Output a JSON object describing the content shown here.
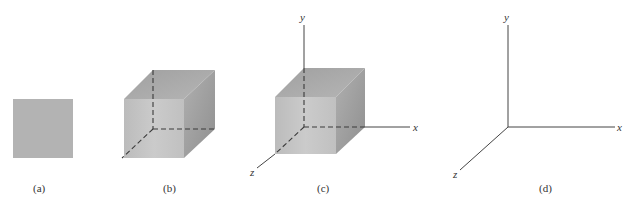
{
  "figure": {
    "panels": [
      {
        "id": "a",
        "label": "(a)",
        "description": "square"
      },
      {
        "id": "b",
        "label": "(b)",
        "description": "cube with hidden edges dashed"
      },
      {
        "id": "c",
        "label": "(c)",
        "description": "cube placed on x-y-z axes"
      },
      {
        "id": "d",
        "label": "(d)",
        "description": "x-y-z axes"
      }
    ],
    "axes_labels": {
      "x": "x",
      "y": "y",
      "z": "z"
    },
    "colors": {
      "face_front": "#b9b9b9",
      "face_top": "#a3a3a3",
      "face_side": "#999999",
      "square": "#b3b3b3",
      "line": "#444444"
    }
  }
}
